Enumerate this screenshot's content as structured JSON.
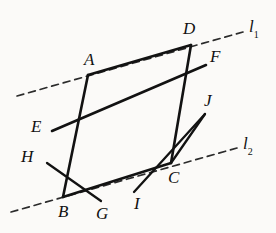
{
  "figure": {
    "type": "geometry-diagram",
    "stroke_color": "#121212",
    "background_color": "#fbfaf8",
    "canvas": {
      "width": 276,
      "height": 233
    },
    "points": {
      "A": {
        "x": 88,
        "y": 75
      },
      "B": {
        "x": 63,
        "y": 197
      },
      "C": {
        "x": 171,
        "y": 163
      },
      "D": {
        "x": 191,
        "y": 45
      },
      "E": {
        "x": 52,
        "y": 131
      },
      "F": {
        "x": 206,
        "y": 65
      },
      "G": {
        "x": 101,
        "y": 201
      },
      "H": {
        "x": 47,
        "y": 163
      },
      "I": {
        "x": 134,
        "y": 192
      },
      "J": {
        "x": 205,
        "y": 114
      }
    },
    "segments": [
      {
        "name": "AD",
        "from": "A",
        "to": "D"
      },
      {
        "name": "AB",
        "from": "A",
        "to": "B"
      },
      {
        "name": "BC",
        "from": "B",
        "to": "C"
      },
      {
        "name": "DC",
        "from": "D",
        "to": "C"
      },
      {
        "name": "EF",
        "from": "E",
        "to": "F"
      },
      {
        "name": "HG",
        "from": "H",
        "to": "G"
      },
      {
        "name": "IJ",
        "from": "I",
        "to": "J"
      },
      {
        "name": "CJ",
        "from": "C",
        "to": "J"
      }
    ],
    "dashed_lines": [
      {
        "name": "l1",
        "x1": 17,
        "y1": 96,
        "x2": 243,
        "y2": 32
      },
      {
        "name": "l2",
        "x1": 11,
        "y1": 212,
        "x2": 237,
        "y2": 148
      }
    ],
    "labels": [
      {
        "id": "A",
        "text": "A",
        "x": 84,
        "y": 51,
        "sub": ""
      },
      {
        "id": "B",
        "text": "B",
        "x": 58,
        "y": 203,
        "sub": ""
      },
      {
        "id": "C",
        "text": "C",
        "x": 168,
        "y": 169,
        "sub": ""
      },
      {
        "id": "D",
        "text": "D",
        "x": 183,
        "y": 20,
        "sub": ""
      },
      {
        "id": "E",
        "text": "E",
        "x": 31,
        "y": 118,
        "sub": ""
      },
      {
        "id": "F",
        "text": "F",
        "x": 210,
        "y": 48,
        "sub": ""
      },
      {
        "id": "G",
        "text": "G",
        "x": 96,
        "y": 205,
        "sub": ""
      },
      {
        "id": "H",
        "text": "H",
        "x": 21,
        "y": 148,
        "sub": ""
      },
      {
        "id": "I",
        "text": "I",
        "x": 134,
        "y": 195,
        "sub": ""
      },
      {
        "id": "J",
        "text": "J",
        "x": 204,
        "y": 92,
        "sub": ""
      },
      {
        "id": "l1",
        "text": "l",
        "x": 249,
        "y": 18,
        "sub": "1"
      },
      {
        "id": "l2",
        "text": "l",
        "x": 243,
        "y": 135,
        "sub": "2"
      }
    ]
  }
}
